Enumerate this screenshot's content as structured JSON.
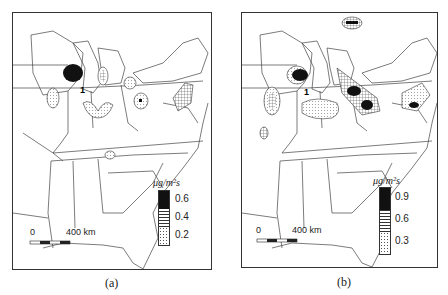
{
  "figure": {
    "panels": [
      {
        "id": "a",
        "caption": "(a)",
        "legend": {
          "unit": "μg/m²s",
          "ticks": [
            "0.6",
            "0.4",
            "0.2"
          ]
        },
        "scale_bar": {
          "start": "0",
          "end": "400 km"
        },
        "annotation": "1"
      },
      {
        "id": "b",
        "caption": "(b)",
        "legend": {
          "unit": "μg/m²s",
          "ticks": [
            "0.9",
            "0.6",
            "0.3"
          ]
        },
        "scale_bar": {
          "start": "0",
          "end": "400 km"
        },
        "annotation": "1"
      }
    ]
  }
}
